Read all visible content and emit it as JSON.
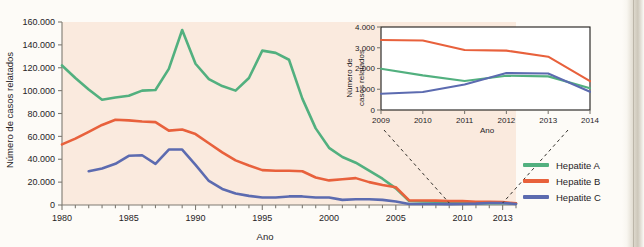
{
  "figure": {
    "background_color": "#fdfbf7",
    "plot_background_color": "#faeade"
  },
  "colors": {
    "hepatite_a": "#52b07f",
    "hepatite_b": "#e8613c",
    "hepatite_c": "#5c6bb0",
    "axis": "#7e7a72",
    "text": "#26231f"
  },
  "legend": {
    "position": "bottom-right",
    "items": [
      {
        "label": "Hepatite A",
        "color": "#52b07f"
      },
      {
        "label": "Hepatite B",
        "color": "#e8613c"
      },
      {
        "label": "Hepatite C",
        "color": "#5c6bb0"
      }
    ]
  },
  "chart_data": [
    {
      "id": "main",
      "type": "line",
      "title": "",
      "xlabel": "Ano",
      "ylabel": "Número de casos relatados",
      "xlim": [
        1980,
        2014
      ],
      "ylim": [
        0,
        160000
      ],
      "grid": false,
      "xticks": [
        1980,
        1985,
        1990,
        1995,
        2000,
        2005,
        2010,
        2013
      ],
      "xtick_labels": [
        "1980",
        "1985",
        "1990",
        "1995",
        "2000",
        "2005",
        "2010",
        "2013"
      ],
      "yticks": [
        0,
        20000,
        40000,
        60000,
        80000,
        100000,
        120000,
        140000,
        160000
      ],
      "ytick_labels": [
        "0",
        "20.000",
        "40.000",
        "60.000",
        "80.000",
        "100.000",
        "120.000",
        "140.000",
        "160.000"
      ],
      "series": [
        {
          "name": "Hepatite A",
          "color": "#52b07f",
          "x": [
            1980,
            1981,
            1982,
            1983,
            1984,
            1985,
            1986,
            1987,
            1988,
            1989,
            1990,
            1991,
            1992,
            1993,
            1994,
            1995,
            1996,
            1997,
            1998,
            1999,
            2000,
            2001,
            2002,
            2003,
            2004,
            2005,
            2006,
            2007,
            2008,
            2009,
            2010,
            2011,
            2012,
            2013,
            2014
          ],
          "values": [
            122000,
            111000,
            101000,
            92000,
            94000,
            95500,
            100000,
            100500,
            119000,
            153000,
            123500,
            110000,
            104000,
            100000,
            111000,
            135000,
            133000,
            127000,
            93000,
            67000,
            50000,
            42000,
            37000,
            30000,
            23000,
            14500,
            3500,
            3000,
            2800,
            2000,
            1700,
            1400,
            1600,
            1700,
            1200
          ]
        },
        {
          "name": "Hepatite B",
          "color": "#e8613c",
          "x": [
            1980,
            1981,
            1982,
            1983,
            1984,
            1985,
            1986,
            1987,
            1988,
            1989,
            1990,
            1991,
            1992,
            1993,
            1994,
            1995,
            1996,
            1997,
            1998,
            1999,
            2000,
            2001,
            2002,
            2003,
            2004,
            2005,
            2006,
            2007,
            2008,
            2009,
            2010,
            2011,
            2012,
            2013,
            2014
          ],
          "values": [
            53000,
            58000,
            64000,
            70000,
            74500,
            74000,
            73000,
            72500,
            65000,
            66000,
            62000,
            54000,
            46000,
            39000,
            34500,
            30500,
            30000,
            30000,
            29500,
            24000,
            21500,
            22500,
            23500,
            20000,
            17500,
            15500,
            4000,
            3900,
            3800,
            3400,
            3400,
            2900,
            2800,
            2600,
            1400
          ]
        },
        {
          "name": "Hepatite C",
          "color": "#5c6bb0",
          "x": [
            1982,
            1983,
            1984,
            1985,
            1986,
            1987,
            1988,
            1989,
            1990,
            1991,
            1992,
            1993,
            1994,
            1995,
            1996,
            1997,
            1998,
            1999,
            2000,
            2001,
            2002,
            2003,
            2004,
            2005,
            2006,
            2007,
            2008,
            2009,
            2010,
            2011,
            2012,
            2013,
            2014
          ],
          "values": [
            29500,
            32000,
            36000,
            43000,
            43500,
            36000,
            48500,
            48500,
            35000,
            21000,
            14000,
            10000,
            8000,
            6500,
            6500,
            7500,
            7500,
            6500,
            6500,
            4500,
            5000,
            5000,
            4500,
            3000,
            900,
            900,
            900,
            800,
            900,
            1200,
            1800,
            1800,
            900
          ]
        }
      ]
    },
    {
      "id": "inset",
      "type": "line",
      "title": "",
      "xlabel": "Ano",
      "ylabel": "Número de casos relatados",
      "xlim": [
        2009,
        2014
      ],
      "ylim": [
        0,
        4000
      ],
      "grid": false,
      "xticks": [
        2009,
        2010,
        2011,
        2012,
        2013,
        2014
      ],
      "xtick_labels": [
        "2009",
        "2010",
        "2011",
        "2012",
        "2013",
        "2014"
      ],
      "yticks": [
        0,
        1000,
        2000,
        3000,
        4000
      ],
      "ytick_labels": [
        "0",
        "1.000",
        "2.000",
        "3.000",
        "4.000"
      ],
      "series": [
        {
          "name": "Hepatite A",
          "color": "#52b07f",
          "x": [
            2009,
            2010,
            2011,
            2012,
            2013,
            2014
          ],
          "values": [
            1990,
            1670,
            1400,
            1650,
            1620,
            1050
          ]
        },
        {
          "name": "Hepatite B",
          "color": "#e8613c",
          "x": [
            2009,
            2010,
            2011,
            2012,
            2013,
            2014
          ],
          "values": [
            3370,
            3350,
            2890,
            2860,
            2570,
            1390
          ]
        },
        {
          "name": "Hepatite C",
          "color": "#5c6bb0",
          "x": [
            2009,
            2010,
            2011,
            2012,
            2013,
            2014
          ],
          "values": [
            780,
            870,
            1230,
            1780,
            1760,
            880
          ]
        }
      ]
    }
  ]
}
